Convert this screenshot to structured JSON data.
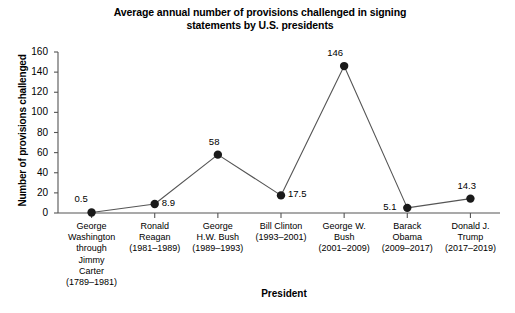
{
  "chart_data": {
    "type": "line",
    "title": "Average annual number of provisions challenged in signing statements by U.S. presidents",
    "title_lines": [
      "Average annual number of provisions challenged in signing",
      "statements by U.S. presidents"
    ],
    "xlabel": "President",
    "ylabel": "Number of provisions challenged",
    "ylim": [
      0,
      160
    ],
    "ytick_step": 20,
    "yticks": [
      "160",
      "140",
      "120",
      "100",
      "80",
      "60",
      "40",
      "20",
      "0"
    ],
    "grid": false,
    "legend": false,
    "marker": "filled-circle",
    "line_color": "#555555",
    "marker_color": "#1a1a1a",
    "axis_color": "#555555",
    "categories": [
      "George Washington through Jimmy Carter (1789–1981)",
      "Ronald Reagan (1981–1989)",
      "George H.W. Bush (1989–1993)",
      "Bill Clinton (1993–2001)",
      "George W. Bush (2001–2009)",
      "Barack Obama (2009–2017)",
      "Donald J. Trump (2017–2019)"
    ],
    "category_lines": [
      [
        "George",
        "Washington",
        "through",
        "Jimmy",
        "Carter",
        "(1789–1981)"
      ],
      [
        "Ronald",
        "Reagan",
        "(1981–1989)"
      ],
      [
        "George",
        "H.W. Bush",
        "(1989–1993)"
      ],
      [
        "Bill Clinton",
        "(1993–2001)"
      ],
      [
        "George W.",
        "Bush",
        "(2001–2009)"
      ],
      [
        "Barack",
        "Obama",
        "(2009–2017)"
      ],
      [
        "Donald J.",
        "Trump",
        "(2017–2019)"
      ]
    ],
    "values": [
      0.5,
      8.9,
      58,
      17.5,
      146,
      5.1,
      14.3
    ],
    "value_labels": [
      "0.5",
      "8.9",
      "58",
      "17.5",
      "146",
      "5.1",
      "14.3"
    ]
  }
}
